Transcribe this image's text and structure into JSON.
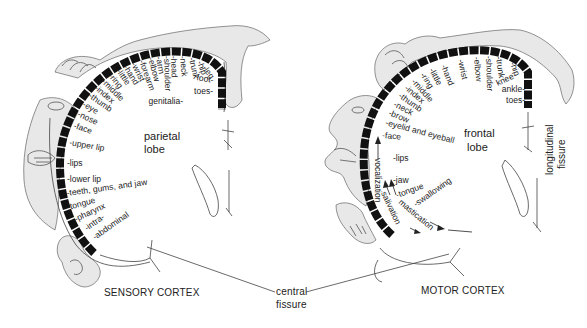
{
  "sensory": {
    "title": "SENSORY CORTEX",
    "lobe_line1": "parietal",
    "lobe_line2": "lobe",
    "labels": [
      {
        "text": "genitalia",
        "x": 183,
        "y": 104,
        "rot": 0,
        "anchor": "end"
      },
      {
        "text": "toes",
        "x": 213,
        "y": 94,
        "rot": 0,
        "anchor": "end"
      },
      {
        "text": "foot",
        "x": 213,
        "y": 83,
        "rot": 10,
        "anchor": "end"
      },
      {
        "text": "leg",
        "x": 202,
        "y": 68,
        "rot": 55,
        "anchor": "start"
      },
      {
        "text": "hip",
        "x": 197,
        "y": 62,
        "rot": 70,
        "anchor": "start"
      },
      {
        "text": "trunk",
        "x": 189,
        "y": 58,
        "rot": 78,
        "anchor": "start"
      },
      {
        "text": "neck",
        "x": 180,
        "y": 56,
        "rot": 85,
        "anchor": "start"
      },
      {
        "text": "head",
        "x": 171,
        "y": 56,
        "rot": 88,
        "anchor": "start"
      },
      {
        "text": "shoulder",
        "x": 164,
        "y": 56,
        "rot": 88,
        "anchor": "start"
      },
      {
        "text": "arm",
        "x": 156,
        "y": 57,
        "rot": 80,
        "anchor": "start"
      },
      {
        "text": "elbow",
        "x": 148,
        "y": 58,
        "rot": 75,
        "anchor": "start"
      },
      {
        "text": "forearm",
        "x": 139,
        "y": 61,
        "rot": 70,
        "anchor": "start"
      },
      {
        "text": "wrist",
        "x": 131,
        "y": 64,
        "rot": 63,
        "anchor": "start"
      },
      {
        "text": "hand",
        "x": 123,
        "y": 67,
        "rot": 58,
        "anchor": "start"
      },
      {
        "text": "little",
        "x": 116,
        "y": 71,
        "rot": 55,
        "anchor": "start"
      },
      {
        "text": "ring",
        "x": 108,
        "y": 76,
        "rot": 50,
        "anchor": "start"
      },
      {
        "text": "middle",
        "x": 101,
        "y": 82,
        "rot": 45,
        "anchor": "start"
      },
      {
        "text": "index",
        "x": 94,
        "y": 89,
        "rot": 40,
        "anchor": "start"
      },
      {
        "text": "thumb",
        "x": 88,
        "y": 97,
        "rot": 35,
        "anchor": "start"
      },
      {
        "text": "eye",
        "x": 82,
        "y": 106,
        "rot": 30,
        "anchor": "start"
      },
      {
        "text": "nose",
        "x": 77,
        "y": 116,
        "rot": 25,
        "anchor": "start"
      },
      {
        "text": "face",
        "x": 73,
        "y": 128,
        "rot": 18,
        "anchor": "start"
      },
      {
        "text": "upper lip",
        "x": 69,
        "y": 145,
        "rot": 10,
        "anchor": "start"
      },
      {
        "text": "lips",
        "x": 67,
        "y": 166,
        "rot": 0,
        "anchor": "start"
      },
      {
        "text": "lower lip",
        "x": 67,
        "y": 182,
        "rot": 0,
        "anchor": "start"
      },
      {
        "text": "teeth, gums, and jaw",
        "x": 67,
        "y": 196,
        "rot": -8,
        "anchor": "start"
      },
      {
        "text": "tongue",
        "x": 68,
        "y": 210,
        "rot": -15,
        "anchor": "start"
      },
      {
        "text": "pharynx",
        "x": 76,
        "y": 222,
        "rot": -25,
        "anchor": "start"
      },
      {
        "text": "intra-",
        "x": 87,
        "y": 231,
        "rot": -35,
        "anchor": "start"
      },
      {
        "text": "abdominal",
        "x": 95,
        "y": 240,
        "rot": -35,
        "anchor": "start"
      }
    ]
  },
  "motor": {
    "title": "MOTOR CORTEX",
    "lobe_line1": "frontal",
    "lobe_line2": "lobe",
    "labels": [
      {
        "text": "toes",
        "x": 525,
        "y": 103,
        "rot": 0,
        "anchor": "end"
      },
      {
        "text": "ankle",
        "x": 525,
        "y": 92,
        "rot": 0,
        "anchor": "end"
      },
      {
        "text": "knee",
        "x": 517,
        "y": 77,
        "rot": -25,
        "anchor": "end"
      },
      {
        "text": "hip",
        "x": 510,
        "y": 63,
        "rot": 70,
        "anchor": "start"
      },
      {
        "text": "trunk",
        "x": 496,
        "y": 57,
        "rot": 82,
        "anchor": "start"
      },
      {
        "text": "shoulder",
        "x": 486,
        "y": 56,
        "rot": 88,
        "anchor": "start"
      },
      {
        "text": "elbow",
        "x": 474,
        "y": 57,
        "rot": 85,
        "anchor": "start"
      },
      {
        "text": "wrist",
        "x": 458,
        "y": 60,
        "rot": 78,
        "anchor": "start"
      },
      {
        "text": "hand",
        "x": 441,
        "y": 66,
        "rot": 68,
        "anchor": "start"
      },
      {
        "text": "little",
        "x": 429,
        "y": 70,
        "rot": 62,
        "anchor": "start"
      },
      {
        "text": "ring",
        "x": 420,
        "y": 75,
        "rot": 56,
        "anchor": "start"
      },
      {
        "text": "middle",
        "x": 411,
        "y": 82,
        "rot": 48,
        "anchor": "start"
      },
      {
        "text": "index",
        "x": 404,
        "y": 89,
        "rot": 40,
        "anchor": "start"
      },
      {
        "text": "thumb",
        "x": 398,
        "y": 97,
        "rot": 35,
        "anchor": "start"
      },
      {
        "text": "neck",
        "x": 393,
        "y": 106,
        "rot": 28,
        "anchor": "start"
      },
      {
        "text": "brow",
        "x": 388,
        "y": 115,
        "rot": 22,
        "anchor": "start"
      },
      {
        "text": "eyelid and eyeball",
        "x": 385,
        "y": 125,
        "rot": 15,
        "anchor": "start"
      },
      {
        "text": "face",
        "x": 382,
        "y": 138,
        "rot": 5,
        "anchor": "start"
      },
      {
        "text": "lips",
        "x": 393,
        "y": 161,
        "rot": 0,
        "anchor": "start"
      },
      {
        "text": "jaw",
        "x": 393,
        "y": 183,
        "rot": 0,
        "anchor": "start"
      },
      {
        "text": "tongue",
        "x": 397,
        "y": 198,
        "rot": -20,
        "anchor": "start"
      },
      {
        "text": "swallowing",
        "x": 416,
        "y": 207,
        "rot": -35,
        "anchor": "start"
      }
    ],
    "vertical_labels": [
      {
        "text": "vocalization",
        "x": 375,
        "y": 158,
        "rot": 90
      },
      {
        "text": "salivation",
        "x": 381,
        "y": 193,
        "rot": 65
      },
      {
        "text": "mastication",
        "x": 398,
        "y": 203,
        "rot": 40
      }
    ]
  },
  "central_fissure": {
    "line1": "central",
    "line2": "fissure"
  },
  "longitudinal_fissure": {
    "line1": "longitudinal",
    "line2": "fissure"
  }
}
